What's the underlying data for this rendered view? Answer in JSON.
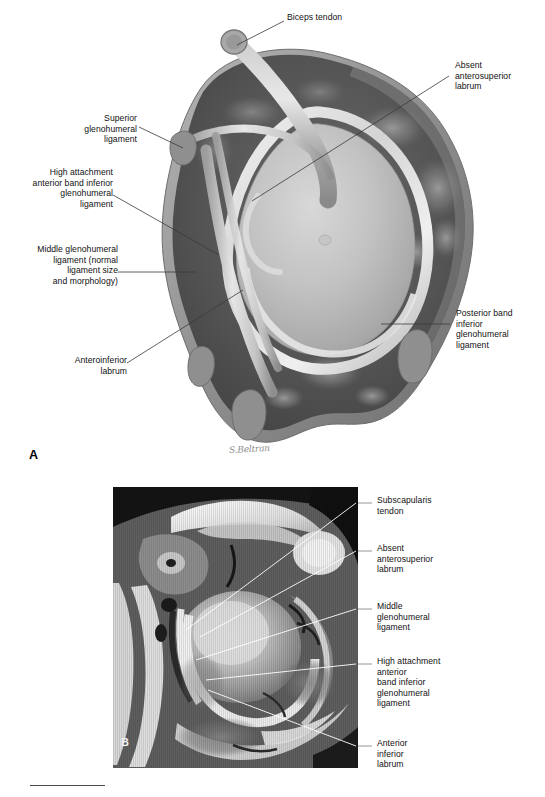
{
  "figure": {
    "type": "medical-illustration-figure",
    "artist_signature": "S.Beltran",
    "panels": [
      {
        "letter": "A",
        "kind": "illustration"
      },
      {
        "letter": "B",
        "kind": "mri-axial"
      }
    ]
  },
  "panel_a": {
    "letter": "A",
    "signature": "S.Beltran",
    "labels": [
      {
        "id": "biceps-tendon",
        "text": "Biceps tendon",
        "side": "top",
        "lines": [
          "Biceps tendon"
        ]
      },
      {
        "id": "absent-anterosuperior-labrum",
        "text": "Absent\nanterosuperior\nlabrum",
        "side": "right",
        "lines": [
          "Absent",
          "anterosuperior",
          "labrum"
        ]
      },
      {
        "id": "superior-glenohumeral-ligament",
        "text": "Superior\nglenohumeral\nligament",
        "side": "left",
        "lines": [
          "Superior",
          "glenohumeral",
          "ligament"
        ]
      },
      {
        "id": "high-attachment-anterior-band",
        "text": "High attachment\nanterior band inferior\nglenohumeral\nligament",
        "side": "left",
        "lines": [
          "High attachment",
          "anterior band inferior",
          "glenohumeral",
          "ligament"
        ]
      },
      {
        "id": "middle-glenohumeral-ligament",
        "text": "Middle glenohumeral\nligament (normal\nligament size\nand morphology)",
        "side": "left",
        "lines": [
          "Middle glenohumeral",
          "ligament (normal",
          "ligament size",
          "and morphology)"
        ]
      },
      {
        "id": "anteroinferior-labrum",
        "text": "Anteroinferior\nlabrum",
        "side": "left",
        "lines": [
          "Anteroinferior",
          "labrum"
        ]
      },
      {
        "id": "posterior-band-inferior-glenohumeral-ligament",
        "text": "Posterior band\ninferior\nglenohumeral\nligament",
        "side": "right",
        "lines": [
          "Posterior band",
          "inferior",
          "glenohumeral",
          "ligament"
        ]
      }
    ]
  },
  "panel_b": {
    "letter": "B",
    "labels": [
      {
        "id": "subscapularis-tendon",
        "text": "Subscapularis\ntendon",
        "side": "right",
        "lines": [
          "Subscapularis",
          "tendon"
        ]
      },
      {
        "id": "absent-anterosuperior-labrum",
        "text": "Absent\nanterosuperior\nlabrum",
        "side": "right",
        "lines": [
          "Absent",
          "anterosuperior",
          "labrum"
        ]
      },
      {
        "id": "middle-glenohumeral-ligament",
        "text": "Middle\nglenohumeral\nligament",
        "side": "right",
        "lines": [
          "Middle",
          "glenohumeral",
          "ligament"
        ]
      },
      {
        "id": "high-attachment-anterior-band",
        "text": "High attachment\nanterior\nband inferior\nglenohumeral\nligament",
        "side": "right",
        "lines": [
          "High attachment",
          "anterior",
          "band inferior",
          "glenohumeral",
          "ligament"
        ]
      },
      {
        "id": "anterior-inferior-labrum",
        "text": "Anterior\ninferior\nlabrum",
        "side": "right",
        "lines": [
          "Anterior",
          "inferior",
          "labrum"
        ]
      }
    ]
  },
  "colors": {
    "background": "#ffffff",
    "label_text": "#111111",
    "leader_line_a": "#3a3a3a",
    "leader_line_b": "#ffffff",
    "signature": "#8d8d8d",
    "rule": "#4a4a4a",
    "capsule_outer": "#9a9a9a",
    "capsule_interior": "#4d4d4d",
    "glenoid_face": "#b9b9b9",
    "labrum_bright": "#e4e4e4"
  }
}
